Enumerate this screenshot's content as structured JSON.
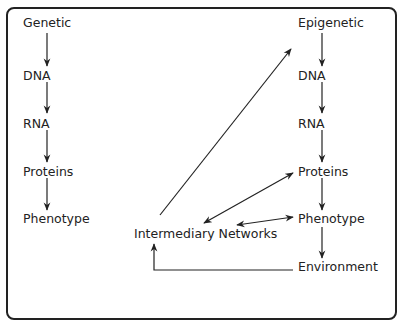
{
  "left_column": {
    "nodes": [
      "Genetic",
      "DNA",
      "RNA",
      "Proteins",
      "Phenotype"
    ]
  },
  "right_column": {
    "nodes": [
      "Epigenetic",
      "DNA",
      "RNA",
      "Proteins",
      "Phenotype",
      "Environment"
    ]
  },
  "center": {
    "node": "Intermediary Networks"
  },
  "edges": [
    {
      "from": "Genetic",
      "to": "DNA"
    },
    {
      "from": "DNA",
      "to": "RNA"
    },
    {
      "from": "RNA",
      "to": "Proteins"
    },
    {
      "from": "Proteins",
      "to": "Phenotype"
    },
    {
      "from": "Epigenetic",
      "to": "DNA (right)"
    },
    {
      "from": "DNA (right)",
      "to": "RNA (right)"
    },
    {
      "from": "RNA (right)",
      "to": "Proteins (right)"
    },
    {
      "from": "Proteins (right)",
      "to": "Phenotype (right)"
    },
    {
      "from": "Phenotype (right)",
      "to": "Environment"
    },
    {
      "from": "Intermediary Networks",
      "to": "Epigenetic"
    },
    {
      "from": "Intermediary Networks",
      "to": "Proteins (right)",
      "bidirectional": true
    },
    {
      "from": "Intermediary Networks",
      "to": "Phenotype (right)",
      "bidirectional": true
    },
    {
      "from": "Environment",
      "to": "Intermediary Networks"
    }
  ]
}
